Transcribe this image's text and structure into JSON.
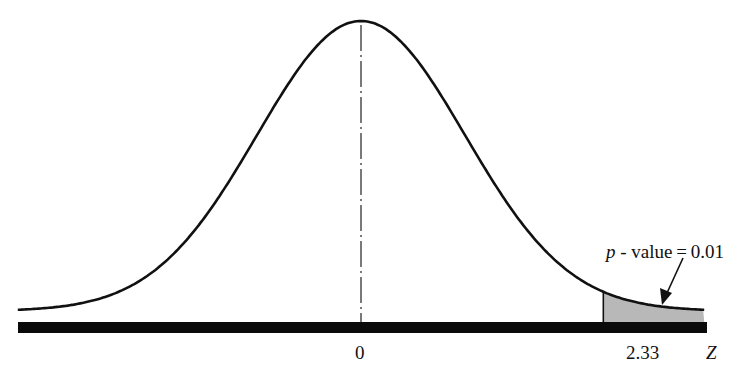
{
  "chart_data": {
    "type": "area",
    "title": "",
    "xlabel": "Z",
    "ylabel": "",
    "x_ticks": [
      {
        "value": 0,
        "label": "0"
      },
      {
        "value": 2.33,
        "label": "2.33"
      }
    ],
    "x_range": [
      -3.3,
      3.3
    ],
    "distribution": {
      "name": "standard normal",
      "mean": 0,
      "sd": 1
    },
    "shaded_region": {
      "from": 2.33,
      "to": 3.3,
      "area": 0.01,
      "color": "#b8b8b8"
    },
    "center_line": {
      "x": 0,
      "style": "dash-dot"
    },
    "annotation": {
      "text_italic": "p",
      "text_rest": " - value = 0.01",
      "points_to": "shaded tail region"
    },
    "grid": false,
    "legend": null
  },
  "labels": {
    "zero": "0",
    "cutoff": "2.33",
    "axis": "Z",
    "pvalue_p": "p",
    "pvalue_rest": " - value = 0.01"
  },
  "colors": {
    "curve": "#111111",
    "axis_bar": "#0a0a0a",
    "shade": "#b8b8b8"
  }
}
